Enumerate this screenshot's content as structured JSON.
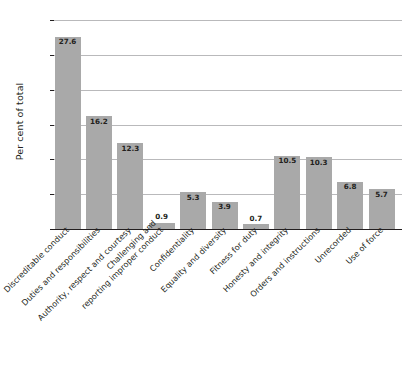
{
  "chart_data": {
    "type": "bar",
    "title": "",
    "xlabel": "",
    "ylabel": "Per cent of total",
    "ylim": [
      0,
      30
    ],
    "yticks": [
      0,
      5,
      10,
      15,
      20,
      25,
      30
    ],
    "ytick_labels": [
      "0",
      "5",
      "10",
      "15",
      "20",
      "25",
      "30"
    ],
    "grid": true,
    "legend": "none",
    "bar_color": "#a9a9a9",
    "categories": [
      "Discreditable conduct",
      "Duties and responsibilities",
      "Authority, respect and courtesy",
      "Challenging and\nreporting improper conduct",
      "Confidentiality",
      "Equality and diversity",
      "Fitness for duty",
      "Honesty and integrity",
      "Orders and instructions",
      "Unrecorded",
      "Use of force"
    ],
    "values": [
      27.6,
      16.2,
      12.3,
      0.9,
      5.3,
      3.9,
      0.7,
      10.5,
      10.3,
      6.8,
      5.7
    ],
    "value_labels": [
      "27.6",
      "16.2",
      "12.3",
      "0.9",
      "5.3",
      "3.9",
      "0.7",
      "10.5",
      "10.3",
      "6.8",
      "5.7"
    ],
    "label_placement": [
      "inside",
      "inside",
      "inside",
      "above",
      "inside",
      "inside",
      "above",
      "inside",
      "inside",
      "inside",
      "inside"
    ]
  }
}
